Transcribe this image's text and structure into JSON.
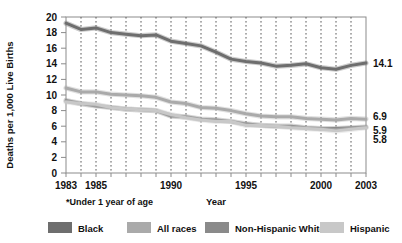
{
  "figure": {
    "y_axis_title": "Deaths per 1,000 Live Births",
    "x_axis_title": "Year",
    "footnote": "*Under 1 year of age"
  },
  "legend": {
    "items": [
      {
        "label": "Black",
        "color": "#6e6e6e"
      },
      {
        "label": "All races",
        "color": "#aaaaaa"
      },
      {
        "label": "Non-Hispanic White",
        "color": "#8a8a8a"
      },
      {
        "label": "Hispanic",
        "color": "#c8c8c8"
      }
    ]
  },
  "end_labels": [
    {
      "name": "black-end-label",
      "value": "14.1"
    },
    {
      "name": "all-races-end-label",
      "value": "6.9"
    },
    {
      "name": "non-hispanic-white-end-label",
      "value": "5.9"
    },
    {
      "name": "hispanic-end-label",
      "value": "5.8"
    }
  ],
  "y_ticks": [
    "20",
    "18",
    "16",
    "14",
    "12",
    "10",
    "8",
    "6",
    "4",
    "2",
    "0"
  ],
  "x_ticks": [
    "1983",
    "1985",
    "1990",
    "1995",
    "2000",
    "2003"
  ],
  "chart_data": {
    "type": "line",
    "title": "",
    "xlabel": "Year",
    "ylabel": "Deaths per 1,000 Live Births",
    "xlim": [
      1983,
      2003
    ],
    "ylim": [
      0,
      20
    ],
    "ytick_step": 2,
    "grid": "vertical dashed gridlines at every year",
    "legend_position": "below plot",
    "x": [
      1983,
      1984,
      1985,
      1986,
      1987,
      1988,
      1989,
      1990,
      1991,
      1992,
      1993,
      1994,
      1995,
      1996,
      1997,
      1998,
      1999,
      2000,
      2001,
      2002,
      2003
    ],
    "series": [
      {
        "name": "Black",
        "color": "#6e6e6e",
        "values": [
          19.2,
          18.4,
          18.6,
          18.0,
          17.8,
          17.6,
          17.7,
          16.9,
          16.6,
          16.3,
          15.5,
          14.6,
          14.3,
          14.1,
          13.7,
          13.8,
          14.0,
          13.5,
          13.3,
          13.8,
          14.1
        ],
        "end_value": 14.1
      },
      {
        "name": "All races",
        "color": "#aaaaaa",
        "values": [
          10.9,
          10.4,
          10.4,
          10.1,
          10.0,
          9.9,
          9.7,
          9.1,
          8.9,
          8.4,
          8.3,
          8.0,
          7.6,
          7.3,
          7.2,
          7.2,
          7.0,
          6.9,
          6.8,
          7.0,
          6.9
        ],
        "end_value": 6.9
      },
      {
        "name": "Non-Hispanic White",
        "color": "#8a8a8a",
        "values": [
          9.3,
          8.9,
          8.6,
          8.4,
          8.2,
          8.1,
          8.0,
          7.3,
          7.2,
          6.9,
          6.8,
          6.6,
          6.3,
          6.1,
          6.0,
          6.0,
          5.8,
          5.7,
          5.7,
          5.8,
          5.9
        ],
        "end_value": 5.9
      },
      {
        "name": "Hispanic",
        "color": "#c8c8c8",
        "values": [
          9.1,
          8.9,
          8.8,
          8.4,
          8.2,
          8.1,
          8.0,
          7.5,
          7.1,
          6.8,
          6.6,
          6.6,
          6.1,
          6.1,
          6.0,
          5.8,
          5.7,
          5.6,
          5.4,
          5.6,
          5.8
        ],
        "end_value": 5.8
      }
    ]
  }
}
